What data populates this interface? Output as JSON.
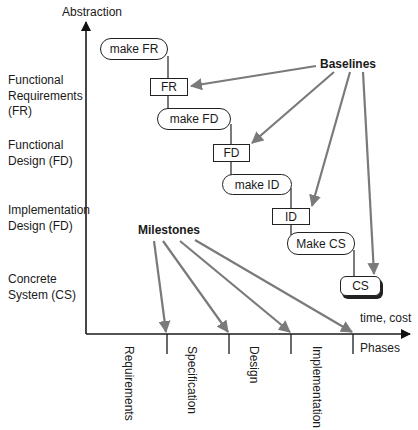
{
  "axes": {
    "y_label": "Abstraction",
    "x_label_top": "time, cost",
    "x_label_bottom": "Phases"
  },
  "levels": [
    {
      "line1": "Functional",
      "line2": "Requirements",
      "line3": "(FR)"
    },
    {
      "line1": "Functional",
      "line2": "Design (FD)"
    },
    {
      "line1": "Implementation",
      "line2": "Design (FD)"
    },
    {
      "line1": "Concrete",
      "line2": "System (CS)"
    }
  ],
  "activities": [
    {
      "label": "make FR"
    },
    {
      "label": "make FD"
    },
    {
      "label": "make ID"
    },
    {
      "label": "Make CS"
    }
  ],
  "artifacts": [
    {
      "label": "FR"
    },
    {
      "label": "FD"
    },
    {
      "label": "ID"
    },
    {
      "label": "CS"
    }
  ],
  "annotations": {
    "baselines": "Baselines",
    "milestones": "Milestones"
  },
  "phases": [
    {
      "label": "Requirements"
    },
    {
      "label": "Specification"
    },
    {
      "label": "Design"
    },
    {
      "label": "Implementation"
    }
  ],
  "colors": {
    "axis": "#1a1a1a",
    "arrow": "#7a7a7a",
    "box_border": "#222222"
  }
}
